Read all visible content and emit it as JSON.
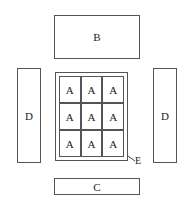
{
  "diagram": {
    "top_box": {
      "label": "B"
    },
    "bottom_box": {
      "label": "C"
    },
    "left_box": {
      "label": "D"
    },
    "right_box": {
      "label": "D"
    },
    "grid": {
      "cells": [
        "A",
        "A",
        "A",
        "A",
        "A",
        "A",
        "A",
        "A",
        "A"
      ],
      "frame_label": "E"
    }
  }
}
